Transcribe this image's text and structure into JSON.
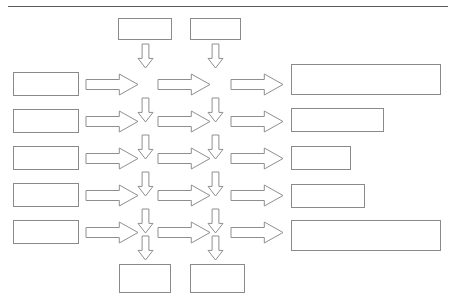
{
  "diagram": {
    "title_rule": "horizontal-rule",
    "top_nodes": [
      {
        "label": "Idee",
        "x": 118,
        "y": 18,
        "w": 54,
        "h": 22
      },
      {
        "label": "Auftrag",
        "x": 190,
        "y": 18,
        "w": 51,
        "h": 22
      }
    ],
    "left_nodes": [
      {
        "label": "Kunden",
        "x": 13,
        "y": 72,
        "w": 66,
        "h": 24
      },
      {
        "label": "Mitarbeiter",
        "x": 13,
        "y": 109,
        "w": 66,
        "h": 24
      },
      {
        "label": "Lieferanten",
        "x": 13,
        "y": 146,
        "w": 66,
        "h": 24
      },
      {
        "label": "Öffentlichkeit",
        "x": 13,
        "y": 183,
        "w": 66,
        "h": 24
      },
      {
        "label": "Ergebnisse",
        "x": 13,
        "y": 220,
        "w": 66,
        "h": 24
      }
    ],
    "right_nodes": [
      {
        "label": "begeistert, unser Unternehmen\nist erster Partner",
        "x": 291,
        "y": 64,
        "w": 150,
        "h": 31
      },
      {
        "label": "kreativ, engagiert",
        "x": 291,
        "y": 108,
        "w": 93,
        "h": 24
      },
      {
        "label": "exzellent",
        "x": 291,
        "y": 146,
        "w": 60,
        "h": 24
      },
      {
        "label": "bestes Image",
        "x": 291,
        "y": 184,
        "w": 74,
        "h": 24
      },
      {
        "label": "Marktführer,\nhervorragende Vermögensrendite",
        "x": 291,
        "y": 220,
        "w": 150,
        "h": 31
      }
    ],
    "bottom_nodes": [
      {
        "label": "fertiges\nProdukt",
        "x": 119,
        "y": 264,
        "w": 52,
        "h": 29
      },
      {
        "label": "Rechnung\nbezahlt",
        "x": 190,
        "y": 264,
        "w": 55,
        "h": 29
      }
    ],
    "right_arrows": [
      {
        "x": 86,
        "y": 74,
        "w": 52,
        "h": 21
      },
      {
        "x": 158,
        "y": 74,
        "w": 52,
        "h": 21
      },
      {
        "x": 231,
        "y": 74,
        "w": 52,
        "h": 21
      },
      {
        "x": 86,
        "y": 111,
        "w": 52,
        "h": 21
      },
      {
        "x": 158,
        "y": 111,
        "w": 52,
        "h": 21
      },
      {
        "x": 231,
        "y": 111,
        "w": 52,
        "h": 21
      },
      {
        "x": 86,
        "y": 148,
        "w": 52,
        "h": 21
      },
      {
        "x": 158,
        "y": 148,
        "w": 52,
        "h": 21
      },
      {
        "x": 231,
        "y": 148,
        "w": 52,
        "h": 21
      },
      {
        "x": 86,
        "y": 185,
        "w": 52,
        "h": 21
      },
      {
        "x": 158,
        "y": 185,
        "w": 52,
        "h": 21
      },
      {
        "x": 231,
        "y": 185,
        "w": 52,
        "h": 21
      },
      {
        "x": 86,
        "y": 222,
        "w": 52,
        "h": 21
      },
      {
        "x": 158,
        "y": 222,
        "w": 52,
        "h": 21
      },
      {
        "x": 231,
        "y": 222,
        "w": 52,
        "h": 21
      }
    ],
    "down_arrows": [
      {
        "x": 138,
        "y": 44,
        "w": 15,
        "h": 24
      },
      {
        "x": 208,
        "y": 44,
        "w": 15,
        "h": 24
      },
      {
        "x": 138,
        "y": 98,
        "w": 15,
        "h": 24
      },
      {
        "x": 208,
        "y": 98,
        "w": 15,
        "h": 24
      },
      {
        "x": 138,
        "y": 135,
        "w": 15,
        "h": 24
      },
      {
        "x": 208,
        "y": 135,
        "w": 15,
        "h": 24
      },
      {
        "x": 138,
        "y": 172,
        "w": 15,
        "h": 24
      },
      {
        "x": 208,
        "y": 172,
        "w": 15,
        "h": 24
      },
      {
        "x": 138,
        "y": 209,
        "w": 15,
        "h": 24
      },
      {
        "x": 208,
        "y": 209,
        "w": 15,
        "h": 24
      },
      {
        "x": 138,
        "y": 236,
        "w": 15,
        "h": 24
      },
      {
        "x": 208,
        "y": 236,
        "w": 15,
        "h": 24
      }
    ]
  }
}
